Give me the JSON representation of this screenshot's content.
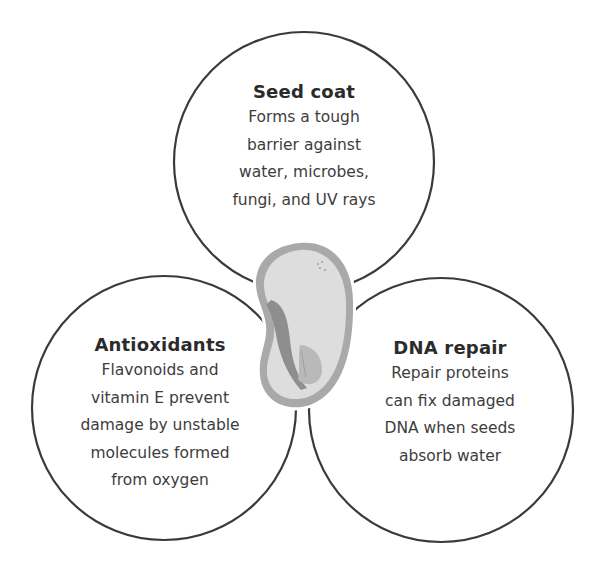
{
  "diagram": {
    "type": "three-circle cluster around central seed illustration",
    "colors": {
      "circle_stroke": "#3a3a3a",
      "background": "#ffffff",
      "seed_coat": "#a8a8a8",
      "seed_inner": "#dcdcdc",
      "seed_embryo_dark": "#8f8f8f",
      "seed_embryo_light": "#b8b8b8",
      "title_text": "#2b2b2b",
      "body_text": "#3d3d3d"
    },
    "center_icon": "seed-icon",
    "circles": [
      {
        "id": "seed-coat",
        "title": "Seed coat",
        "lines": [
          "Forms a tough",
          "barrier against",
          "water, microbes,",
          "fungi, and UV rays"
        ]
      },
      {
        "id": "antioxidants",
        "title": "Antioxidants",
        "lines": [
          "Flavonoids and",
          "vitamin E prevent",
          "damage by unstable",
          "molecules formed",
          "from oxygen"
        ]
      },
      {
        "id": "dna-repair",
        "title": "DNA repair",
        "lines": [
          "Repair proteins",
          "can fix damaged",
          "DNA when seeds",
          "absorb water"
        ]
      }
    ]
  }
}
